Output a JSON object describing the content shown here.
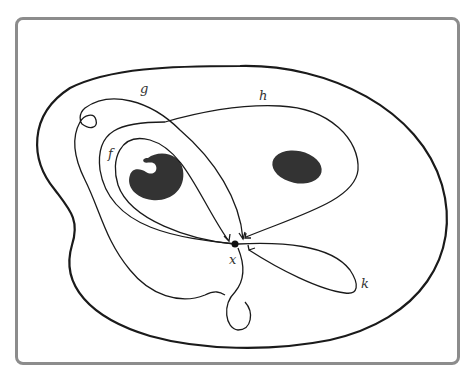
{
  "figure": {
    "type": "topological loop diagram",
    "basepoint": {
      "label": "x",
      "position": [
        235,
        244
      ]
    },
    "loops": [
      {
        "label": "f",
        "label_position": [
          110,
          158
        ]
      },
      {
        "label": "g",
        "label_position": [
          143,
          92
        ]
      },
      {
        "label": "h",
        "label_position": [
          262,
          99
        ]
      },
      {
        "label": "k",
        "label_position": [
          364,
          287
        ]
      }
    ],
    "holes": [
      {
        "name": "left-hole",
        "shape": "notched blob"
      },
      {
        "name": "right-hole",
        "shape": "ellipse"
      }
    ],
    "colors": {
      "frame": "#8c8c8c",
      "stroke": "#1a1a1a",
      "hole_fill": "#333333",
      "background": "#ffffff"
    }
  }
}
